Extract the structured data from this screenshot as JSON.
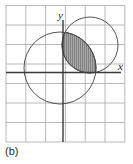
{
  "figure": {
    "caption": "(b)",
    "axis_labels": {
      "x": "x",
      "y": "y"
    },
    "colors": {
      "grid_line": "#b0b0b0",
      "axis_line": "#3a3a3a",
      "curve_stroke": "#555555",
      "shade_fill": "#a9a9a9",
      "hatch_line": "#6e6e6e",
      "background": "#ffffff",
      "text": "#2b2b2b"
    },
    "grid": {
      "columns": 6,
      "rows": 7,
      "cell_width": 19.8,
      "cell_height": 19.6,
      "left": 6,
      "top": 5,
      "right": 125,
      "bottom": 142,
      "visible": true
    },
    "axes": {
      "origin_x": 63,
      "origin_y": 72.5,
      "x_axis_from": 6,
      "x_axis_to": 121,
      "y_axis_from": 20,
      "y_axis_to": 142
    },
    "shapes": [
      {
        "name": "large-circle",
        "type": "circle",
        "cx": 60,
        "cy": 68,
        "r": 36,
        "fill": "none"
      },
      {
        "name": "small-circle",
        "type": "circle",
        "cx": 90,
        "cy": 45,
        "r": 28,
        "fill": "none"
      }
    ],
    "shaded_region": {
      "name": "intersection-lens",
      "description": "lens-shaped intersection of the two circles",
      "hatched": true,
      "hatch_direction": "vertical",
      "hatch_spacing": 2
    }
  }
}
